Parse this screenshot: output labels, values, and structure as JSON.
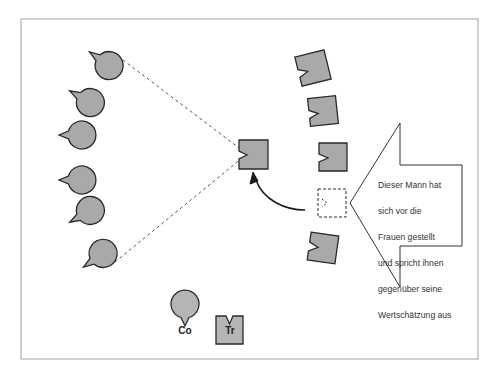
{
  "diagram": {
    "callout": {
      "lines": [
        "Dieser Mann hat",
        "sich vor die",
        "Frauen gestellt",
        "und spricht ihnen",
        "gegenüber seine",
        "Wertschätzung aus"
      ]
    },
    "legend": {
      "co_label": "Co",
      "tr_label": "Tr"
    },
    "colors": {
      "fill": "#a9a9a9",
      "stroke": "#2a2a2a",
      "frame": "#999999"
    }
  }
}
